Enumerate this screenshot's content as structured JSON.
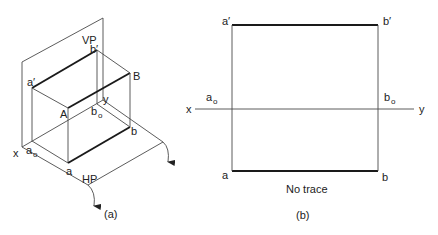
{
  "figure_a": {
    "caption": "(a)",
    "planes": {
      "vp": "VP",
      "hp": "HP"
    },
    "axis": {
      "x": "x",
      "y": "y"
    },
    "points": {
      "a_prime": "a′",
      "b_prime": "b′",
      "A": "A",
      "B": "B",
      "a_sub": "a",
      "a_sub_index": "o",
      "b_sub": "b",
      "b_sub_index": "o",
      "a": "a",
      "b": "b"
    }
  },
  "figure_b": {
    "caption": "(b)",
    "axis": {
      "x": "x",
      "y": "y"
    },
    "points": {
      "a_prime": "a′",
      "b_prime": "b′",
      "a_sub": "a",
      "a_sub_index": "o",
      "b_sub": "b",
      "b_sub_index": "o",
      "a": "a",
      "b": "b"
    },
    "note": "No trace"
  },
  "colors": {
    "line": "#4a4a4a",
    "bold_line": "#1a1a1a",
    "text": "#222222",
    "background": "#ffffff"
  }
}
